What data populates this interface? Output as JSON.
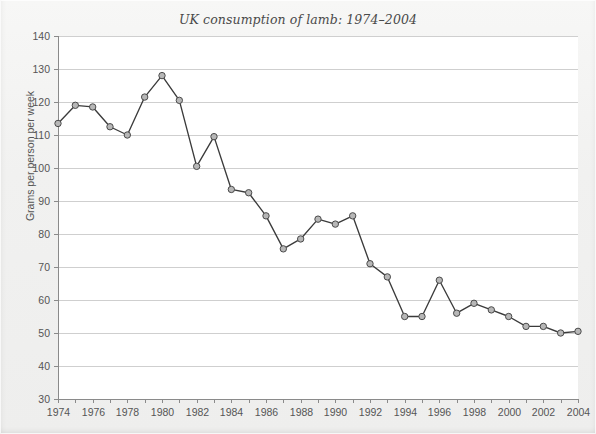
{
  "chart_data": {
    "type": "line",
    "title": "UK consumption of lamb: 1974–2004",
    "xlabel": "",
    "ylabel": "Grams per person per week",
    "xlim": [
      1974,
      2004
    ],
    "ylim": [
      30,
      140
    ],
    "ytick_step": 10,
    "yticks": [
      30,
      40,
      50,
      60,
      70,
      80,
      90,
      100,
      110,
      120,
      130,
      140
    ],
    "ytick_labels": [
      "30",
      "40",
      "50",
      "60",
      "70",
      "80",
      "90",
      "100",
      "110",
      "120",
      "130",
      "140"
    ],
    "xticks": [
      1974,
      1975,
      1976,
      1977,
      1978,
      1979,
      1980,
      1981,
      1982,
      1983,
      1984,
      1985,
      1986,
      1987,
      1988,
      1989,
      1990,
      1991,
      1992,
      1993,
      1994,
      1995,
      1996,
      1997,
      1998,
      1999,
      2000,
      2001,
      2002,
      2003,
      2004
    ],
    "xtick_labels_shown": [
      "1974",
      "1976",
      "1978",
      "1980",
      "1982",
      "1984",
      "1986",
      "1988",
      "1990",
      "1992",
      "1994",
      "1996",
      "1998",
      "2000",
      "2002",
      "2004"
    ],
    "xtick_label_interval": 2,
    "grid": "horizontal",
    "legend": "none",
    "markers": "circle",
    "x": [
      1974,
      1975,
      1976,
      1977,
      1978,
      1979,
      1980,
      1981,
      1982,
      1983,
      1984,
      1985,
      1986,
      1987,
      1988,
      1989,
      1990,
      1991,
      1992,
      1993,
      1994,
      1995,
      1996,
      1997,
      1998,
      1999,
      2000,
      2001,
      2002,
      2003,
      2004
    ],
    "values": [
      113.5,
      119,
      118.5,
      112.5,
      110,
      121.5,
      128,
      120.5,
      100.5,
      109.5,
      93.5,
      92.5,
      85.5,
      75.5,
      78.5,
      84.5,
      83,
      85.5,
      71,
      67,
      55,
      55,
      66,
      56,
      59,
      57,
      55,
      52,
      52,
      50,
      50.5
    ],
    "series": [
      {
        "name": "UK lamb consumption",
        "values": [
          113.5,
          119,
          118.5,
          112.5,
          110,
          121.5,
          128,
          120.5,
          100.5,
          109.5,
          93.5,
          92.5,
          85.5,
          75.5,
          78.5,
          84.5,
          83,
          85.5,
          71,
          67,
          55,
          55,
          66,
          56,
          59,
          57,
          55,
          52,
          52,
          50,
          50.5
        ]
      }
    ],
    "colors": {
      "line": "#3b3b3b",
      "marker_fill": "#b7b7b7",
      "marker_stroke": "#4a4a4a",
      "grid": "#cfcfcf",
      "axis": "#8a8a8a",
      "plot_background": "#ffffff",
      "page_background": "#f1f1f0",
      "text": "#555555",
      "title_text": "#4a4a4a"
    }
  }
}
